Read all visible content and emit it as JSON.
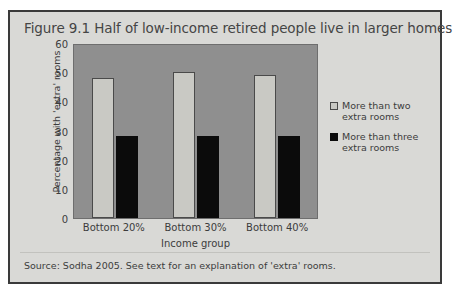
{
  "figure": {
    "title": "Figure 9.1 Half of low-income retired people live in larger homes",
    "source": "Source: Sodha 2005. See text for an explanation of 'extra' rooms."
  },
  "colors": {
    "panel_background": "#d9d9d6",
    "panel_border": "#3a3a3a",
    "plot_background": "#8f8f8f",
    "series_light": "#c9c9c4",
    "series_dark": "#0b0b0b",
    "text": "#3c3c3c"
  },
  "chart_data": {
    "type": "bar",
    "title": "Figure 9.1 Half of low-income retired people live in larger homes",
    "xlabel": "Income group",
    "ylabel": "Percentage with 'extra' rooms",
    "categories": [
      "Bottom 20%",
      "Bottom 30%",
      "Bottom 40%"
    ],
    "series": [
      {
        "name": "More than two extra rooms",
        "color": "#c9c9c4",
        "values": [
          48,
          50,
          49
        ]
      },
      {
        "name": "More than three extra rooms",
        "color": "#0b0b0b",
        "values": [
          28,
          28,
          28
        ]
      }
    ],
    "ylim": [
      0,
      60
    ],
    "yticks": [
      0,
      10,
      20,
      30,
      40,
      50,
      60
    ],
    "ytick_labels": [
      "0",
      "10",
      "20",
      "30",
      "40",
      "50",
      "60"
    ],
    "grid": false,
    "legend_position": "right",
    "legend": [
      {
        "label_line1": "More than two",
        "label_line2": "extra rooms"
      },
      {
        "label_line1": "More than three",
        "label_line2": "extra rooms"
      }
    ]
  }
}
